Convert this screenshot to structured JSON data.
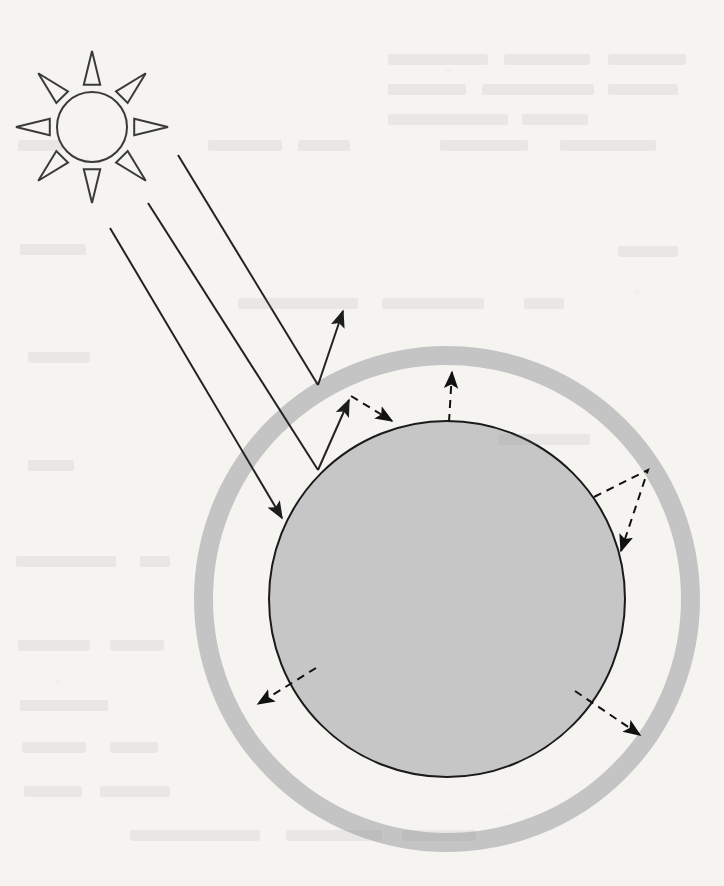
{
  "figure": {
    "kind": "science-diagram",
    "caption": "",
    "canvas": {
      "width": 724,
      "height": 886
    },
    "background_color": "#f5f4f1"
  },
  "colors": {
    "background": "#f5f4f1",
    "stroke": "#1a1a1a",
    "planet_fill": "#c6c6c6",
    "planet_stroke": "#1a1a1a",
    "atmosphere_fill": "#c4c4c4",
    "atmosphere_inner_gap": "#f5f4f1",
    "arrow_solid": "#222222",
    "arrow_dashed": "#111111",
    "sun_stroke": "#3a3a3a",
    "sun_fill": "none"
  },
  "sun": {
    "name": "sun",
    "center": {
      "x": 92,
      "y": 127
    },
    "core_radius": 35,
    "ray_count": 8,
    "ray_inner_radius": 43,
    "ray_outer_radius": 76,
    "ray_half_width_deg": 11,
    "stroke_width": 2,
    "filled": false
  },
  "planet": {
    "name": "planet",
    "center": {
      "x": 447,
      "y": 599
    },
    "radius": 178,
    "fill": "#c6c6c6",
    "stroke": "#1a1a1a",
    "stroke_width": 2
  },
  "atmosphere": {
    "name": "atmosphere-ring",
    "center": {
      "x": 447,
      "y": 599
    },
    "outer_radius": 253,
    "inner_radius": 234,
    "fill": "#c4c4c4",
    "ring_thickness": 19
  },
  "incoming_rays": {
    "label": "incoming solar radiation",
    "style": "solid",
    "stroke_width": 2,
    "rays": [
      {
        "name": "ray-reflected-by-atmosphere",
        "description": "solar ray reflected back to space by the atmosphere",
        "from": {
          "x": 178,
          "y": 155
        },
        "to": {
          "x": 318,
          "y": 385
        },
        "arrowhead_at_end": false,
        "reflection": {
          "from": {
            "x": 318,
            "y": 385
          },
          "to": {
            "x": 343,
            "y": 311
          },
          "arrowhead_at_end": true
        }
      },
      {
        "name": "ray-absorbed-then-reemitted",
        "description": "solar ray passing through the atmosphere, reaching the surface and being re-emitted upward",
        "from": {
          "x": 148,
          "y": 203
        },
        "to": {
          "x": 318,
          "y": 470
        },
        "arrowhead_at_end": false,
        "reflection": {
          "from": {
            "x": 318,
            "y": 470
          },
          "to": {
            "x": 349,
            "y": 400
          },
          "arrowhead_at_end": true
        }
      },
      {
        "name": "ray-absorbed-by-surface",
        "description": "solar ray reaching the planet surface",
        "from": {
          "x": 110,
          "y": 228
        },
        "to": {
          "x": 282,
          "y": 518
        },
        "arrowhead_at_end": true,
        "reflection": null
      }
    ]
  },
  "outgoing_radiation": {
    "label": "infrared radiation emitted by the surface",
    "style": "dashed",
    "stroke_width": 2,
    "dash_pattern": "8,6",
    "paths": [
      {
        "name": "ir-back-radiation-upper-left",
        "description": "infrared radiation re-emitted upward then returned toward the surface",
        "points": [
          {
            "x": 351,
            "y": 396
          },
          {
            "x": 392,
            "y": 421
          }
        ],
        "arrowhead_at_end": true
      },
      {
        "name": "ir-escaping-top",
        "description": "infrared radiation from the surface escaping straight up to the atmosphere",
        "points": [
          {
            "x": 449,
            "y": 422
          },
          {
            "x": 452,
            "y": 372
          }
        ],
        "arrowhead_at_end": true
      },
      {
        "name": "ir-back-radiation-right",
        "description": "infrared radiation leaving the surface, reaching the atmosphere and being radiated back down to the surface",
        "points": [
          {
            "x": 594,
            "y": 497
          },
          {
            "x": 648,
            "y": 470
          },
          {
            "x": 621,
            "y": 551
          }
        ],
        "arrowhead_at_end": true
      },
      {
        "name": "ir-lower-left",
        "description": "infrared radiation emitted from the surface toward the lower left",
        "points": [
          {
            "x": 316,
            "y": 668
          },
          {
            "x": 258,
            "y": 704
          }
        ],
        "arrowhead_at_end": true
      },
      {
        "name": "ir-lower-right",
        "description": "infrared radiation emitted from the surface toward the lower right",
        "points": [
          {
            "x": 575,
            "y": 691
          },
          {
            "x": 640,
            "y": 735
          }
        ],
        "arrowhead_at_end": true
      }
    ]
  },
  "page_bleed_through": {
    "description": "faint ghosting of text printed on the reverse of the page",
    "lines": [
      {
        "x": 388,
        "y": 54,
        "w": 100
      },
      {
        "x": 504,
        "y": 54,
        "w": 86
      },
      {
        "x": 608,
        "y": 54,
        "w": 78
      },
      {
        "x": 388,
        "y": 84,
        "w": 78
      },
      {
        "x": 482,
        "y": 84,
        "w": 112
      },
      {
        "x": 608,
        "y": 84,
        "w": 70
      },
      {
        "x": 388,
        "y": 114,
        "w": 120
      },
      {
        "x": 522,
        "y": 114,
        "w": 66
      },
      {
        "x": 18,
        "y": 140,
        "w": 44
      },
      {
        "x": 208,
        "y": 140,
        "w": 74
      },
      {
        "x": 298,
        "y": 140,
        "w": 52
      },
      {
        "x": 440,
        "y": 140,
        "w": 88
      },
      {
        "x": 560,
        "y": 140,
        "w": 96
      },
      {
        "x": 20,
        "y": 244,
        "w": 66
      },
      {
        "x": 618,
        "y": 246,
        "w": 60
      },
      {
        "x": 238,
        "y": 298,
        "w": 120
      },
      {
        "x": 382,
        "y": 298,
        "w": 102
      },
      {
        "x": 524,
        "y": 298,
        "w": 40
      },
      {
        "x": 28,
        "y": 352,
        "w": 62
      },
      {
        "x": 498,
        "y": 434,
        "w": 92
      },
      {
        "x": 28,
        "y": 460,
        "w": 46
      },
      {
        "x": 16,
        "y": 556,
        "w": 100
      },
      {
        "x": 140,
        "y": 556,
        "w": 30
      },
      {
        "x": 18,
        "y": 640,
        "w": 72
      },
      {
        "x": 110,
        "y": 640,
        "w": 54
      },
      {
        "x": 20,
        "y": 700,
        "w": 88
      },
      {
        "x": 22,
        "y": 742,
        "w": 64
      },
      {
        "x": 110,
        "y": 742,
        "w": 48
      },
      {
        "x": 24,
        "y": 786,
        "w": 58
      },
      {
        "x": 100,
        "y": 786,
        "w": 70
      },
      {
        "x": 130,
        "y": 830,
        "w": 130
      },
      {
        "x": 286,
        "y": 830,
        "w": 96
      },
      {
        "x": 402,
        "y": 830,
        "w": 74
      }
    ]
  }
}
